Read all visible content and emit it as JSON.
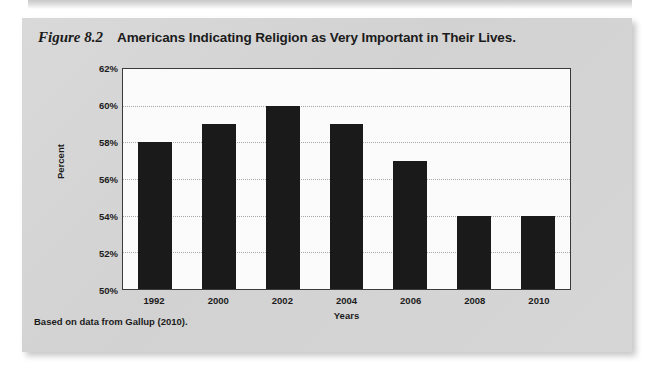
{
  "page": {
    "background_color": "#ffffff",
    "panel_color": "#d5d5d5"
  },
  "figure": {
    "number_label": "Figure 8.2",
    "caption": "Americans Indicating Religion as Very Important in Their Lives.",
    "source_note": "Based on data from Gallup (2010)."
  },
  "chart_data": {
    "type": "bar",
    "title": "Americans Indicating Religion as Very Important in Their Lives.",
    "categories": [
      "1992",
      "2000",
      "2002",
      "2004",
      "2006",
      "2008",
      "2010"
    ],
    "values": [
      58,
      59,
      60,
      59,
      57,
      54,
      54
    ],
    "xlabel": "Years",
    "ylabel": "Percent",
    "ylim": [
      50,
      62
    ],
    "ytick_step": 2,
    "ytick_labels": [
      "62%",
      "60%",
      "58%",
      "56%",
      "54%",
      "52%",
      "50%"
    ],
    "ytick_values": [
      62,
      60,
      58,
      56,
      54,
      52,
      50
    ],
    "grid": true,
    "grid_style": "dotted",
    "grid_color": "#a8a8a8",
    "bar_color": "#1a1a1a",
    "plot_background": "#fbfbfb",
    "legend": "none",
    "value_format": "percent"
  }
}
